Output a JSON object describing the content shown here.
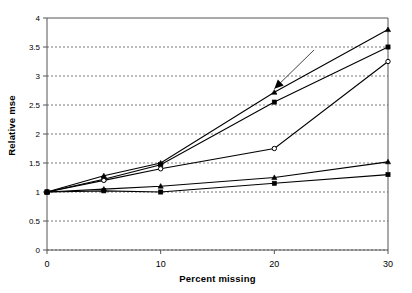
{
  "chart_data": {
    "type": "line",
    "title": "",
    "xlabel": "Percent missing",
    "ylabel": "Relative mse",
    "x": [
      0,
      5,
      10,
      20,
      30
    ],
    "xlim": [
      0,
      30
    ],
    "ylim": [
      0,
      4
    ],
    "xticks": [
      "0",
      "10",
      "20",
      "30"
    ],
    "xtick_values": [
      0,
      10,
      20,
      30
    ],
    "yticks": [
      "0",
      "0.5",
      "1",
      "1.5",
      "2",
      "2.5",
      "3",
      "3.5",
      "4"
    ],
    "ytick_values": [
      0,
      0.5,
      1,
      1.5,
      2,
      2.5,
      3,
      3.5,
      4
    ],
    "grid": "horizontal-dashed",
    "legend": "none",
    "series": [
      {
        "name": "series-1",
        "marker": "triangle",
        "values": [
          1.0,
          1.28,
          1.5,
          2.72,
          3.8
        ]
      },
      {
        "name": "series-2",
        "marker": "square",
        "values": [
          1.0,
          1.22,
          1.47,
          2.55,
          3.5
        ]
      },
      {
        "name": "series-3",
        "marker": "circle",
        "values": [
          1.0,
          1.2,
          1.4,
          1.75,
          3.25
        ]
      },
      {
        "name": "series-4",
        "marker": "triangle",
        "values": [
          1.0,
          1.05,
          1.1,
          1.25,
          1.52
        ]
      },
      {
        "name": "series-5",
        "marker": "square",
        "values": [
          1.0,
          1.02,
          1.0,
          1.15,
          1.3
        ]
      }
    ],
    "annotations": [
      {
        "name": "arrow-annotation",
        "text": "",
        "points_to_x": 20,
        "points_to_y": 2.78,
        "tail_x": 23.5,
        "tail_y": 3.45
      }
    ]
  },
  "axis": {
    "ylabel_text": "Relative mse",
    "xlabel_text": "Percent missing"
  }
}
